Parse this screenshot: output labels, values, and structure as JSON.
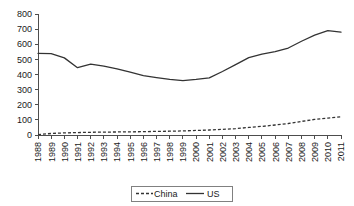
{
  "chart_data": {
    "type": "line",
    "title": "",
    "subtitle": "",
    "xlabel": "",
    "ylabel": "",
    "grid": false,
    "legend_position": "bottom",
    "xlim": [
      1988,
      2011
    ],
    "ylim": [
      0,
      800
    ],
    "y_ticks": [
      0,
      100,
      200,
      300,
      400,
      500,
      600,
      700,
      800
    ],
    "y_tick_labels": [
      "0",
      "100",
      "200",
      "300",
      "400",
      "500",
      "600",
      "700",
      "800"
    ],
    "categories": [
      "1988",
      "1989",
      "1990",
      "1991",
      "1992",
      "1993",
      "1994",
      "1995",
      "1996",
      "1997",
      "1998",
      "1999",
      "2000",
      "2001",
      "2002",
      "2003",
      "2004",
      "2005",
      "2006",
      "2007",
      "2008",
      "2009",
      "2010",
      "2011"
    ],
    "series": [
      {
        "name": "China",
        "style": "dashed",
        "color": "#333333",
        "values": [
          3,
          10,
          14,
          16,
          18,
          19,
          20,
          21,
          22,
          24,
          25,
          27,
          30,
          33,
          37,
          42,
          50,
          57,
          66,
          76,
          90,
          103,
          112,
          120
        ]
      },
      {
        "name": "US",
        "style": "solid",
        "color": "#333333",
        "values": [
          540,
          538,
          510,
          445,
          468,
          455,
          437,
          415,
          393,
          380,
          368,
          360,
          368,
          378,
          420,
          465,
          512,
          535,
          551,
          575,
          620,
          660,
          690,
          680
        ]
      }
    ]
  },
  "legend": {
    "entries": [
      {
        "label": "China",
        "style": "dashed"
      },
      {
        "label": "US",
        "style": "solid"
      }
    ]
  },
  "icons": {
    "line_solid": "solid-line-icon",
    "line_dashed": "dashed-line-icon"
  }
}
